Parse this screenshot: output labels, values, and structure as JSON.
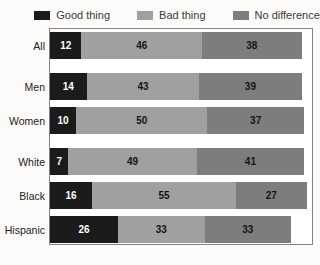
{
  "chart_data": {
    "type": "bar",
    "orientation": "horizontal-stacked",
    "title": "",
    "xlabel": "",
    "ylabel": "",
    "xlim": [
      0,
      100
    ],
    "grid": false,
    "legend_position": "top",
    "categories": [
      "All",
      "Men",
      "Women",
      "White",
      "Black",
      "Hispanic"
    ],
    "series": [
      {
        "name": "Good thing",
        "color": "#1b1b1b",
        "values": [
          12,
          14,
          10,
          7,
          16,
          26
        ]
      },
      {
        "name": "Bad thing",
        "color": "#a0a0a0",
        "values": [
          46,
          43,
          50,
          49,
          55,
          33
        ]
      },
      {
        "name": "No difference",
        "color": "#7d7d7d",
        "values": [
          38,
          39,
          37,
          41,
          27,
          33
        ]
      }
    ],
    "group_breaks_after": [
      "All",
      "Women"
    ],
    "value_labels_shown": true
  },
  "colors": {
    "frame_border": "#838383",
    "plot_background": "#ffffff",
    "page_background": "#fcfbf9",
    "label_text": "#222222",
    "value_on_dark": "#ffffff",
    "value_on_gray": "#141414"
  }
}
